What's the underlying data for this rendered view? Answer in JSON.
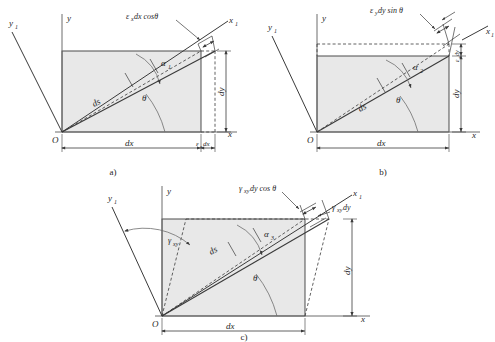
{
  "figure": {
    "background_color": "#ffffff",
    "element_fill_color": "#e8e8e8",
    "line_color": "#3a3a3a",
    "panels": [
      {
        "id": "a",
        "caption": "a)",
        "description": "Elongation of ds due to normal strain in x direction",
        "axes": {
          "x_label": "x",
          "y_label": "y",
          "x1_label": "x",
          "x1_sub": "1",
          "y1_label": "y",
          "y1_sub": "1",
          "origin_label": "O"
        },
        "labels": {
          "deformation": "ε",
          "deformation_sub": "x",
          "deformation_rest": "dx cosθ",
          "bottom_main": "dx",
          "bottom_extra_sym": "ε",
          "bottom_extra_sub": "x",
          "bottom_extra_rest": "dx",
          "right_vertical": "dy",
          "diagonal": "ds",
          "angle_theta": "θ",
          "angle_alpha": "α",
          "angle_alpha_sub": "1"
        }
      },
      {
        "id": "b",
        "caption": "b)",
        "description": "Elongation of ds due to normal strain in y direction",
        "axes": {
          "x_label": "x",
          "y_label": "y",
          "x1_label": "x",
          "x1_sub": "1",
          "y1_label": "y",
          "y1_sub": "1",
          "origin_label": "O"
        },
        "labels": {
          "deformation": "ε",
          "deformation_sub": "y",
          "deformation_rest": "dy sin θ",
          "bottom_main": "dx",
          "right_extra_sym": "ε",
          "right_extra_sub": "y",
          "right_extra_rest": "dy",
          "right_vertical": "dy",
          "diagonal": "ds",
          "angle_theta": "θ",
          "angle_alpha": "α",
          "angle_alpha_sub": "2"
        }
      },
      {
        "id": "c",
        "caption": "c)",
        "description": "Elongation of ds due to shear strain gamma xy",
        "axes": {
          "x_label": "x",
          "y_label": "y",
          "x1_label": "x",
          "x1_sub": "1",
          "y1_label": "y",
          "y1_sub": "1",
          "origin_label": "O"
        },
        "labels": {
          "deformation": "γ",
          "deformation_sub": "xy",
          "deformation_rest": "dy cos θ",
          "shear_top_sym": "γ",
          "shear_top_sub": "xy",
          "shear_top_rest": "dy",
          "shear_angle_sym": "γ",
          "shear_angle_sub": "xy",
          "bottom_main": "dx",
          "right_vertical": "dy",
          "diagonal": "ds",
          "angle_theta": "θ",
          "angle_alpha": "α",
          "angle_alpha_sub": "3"
        }
      }
    ]
  }
}
